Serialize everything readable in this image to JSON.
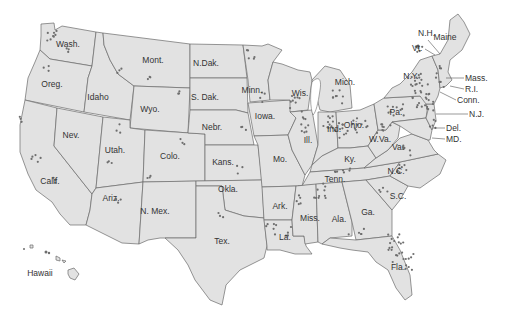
{
  "map": {
    "title": "",
    "background": "#ffffff",
    "state_fill": "#e2e2e2",
    "border_color": "#6a6a6a",
    "dot_color": "#6e6e6e",
    "labels": [
      {
        "id": "wash",
        "text": "Wash.",
        "x": 68,
        "y": 47
      },
      {
        "id": "oreg",
        "text": "Oreg.",
        "x": 52,
        "y": 87
      },
      {
        "id": "idaho",
        "text": "Idaho",
        "x": 98,
        "y": 100
      },
      {
        "id": "mont",
        "text": "Mont.",
        "x": 153,
        "y": 63
      },
      {
        "id": "wyo",
        "text": "Wyo.",
        "x": 150,
        "y": 112
      },
      {
        "id": "ndak",
        "text": "N.Dak.",
        "x": 206,
        "y": 66
      },
      {
        "id": "sdak",
        "text": "S. Dak.",
        "x": 205,
        "y": 100
      },
      {
        "id": "nebr",
        "text": "Nebr.",
        "x": 212,
        "y": 130
      },
      {
        "id": "nev",
        "text": "Nev.",
        "x": 71,
        "y": 138
      },
      {
        "id": "utah",
        "text": "Utah.",
        "x": 115,
        "y": 153
      },
      {
        "id": "colo",
        "text": "Colo.",
        "x": 170,
        "y": 159
      },
      {
        "id": "kans",
        "text": "Kans.",
        "x": 223,
        "y": 165
      },
      {
        "id": "calif",
        "text": "Calif.",
        "x": 50,
        "y": 184
      },
      {
        "id": "ariz",
        "text": "Ariz.",
        "x": 111,
        "y": 201
      },
      {
        "id": "nmex",
        "text": "N. Mex.",
        "x": 155,
        "y": 214
      },
      {
        "id": "okla",
        "text": "Okla.",
        "x": 228,
        "y": 192
      },
      {
        "id": "tex",
        "text": "Tex.",
        "x": 222,
        "y": 244
      },
      {
        "id": "minn",
        "text": "Minn.",
        "x": 252,
        "y": 93
      },
      {
        "id": "iowa",
        "text": "Iowa.",
        "x": 265,
        "y": 119
      },
      {
        "id": "wis",
        "text": "Wis.",
        "x": 300,
        "y": 96
      },
      {
        "id": "mich",
        "text": "Mich.",
        "x": 345,
        "y": 85
      },
      {
        "id": "ill",
        "text": "Ill.",
        "x": 308,
        "y": 143
      },
      {
        "id": "ind",
        "text": "Ind.",
        "x": 334,
        "y": 132
      },
      {
        "id": "ohio",
        "text": "Ohio.",
        "x": 354,
        "y": 128
      },
      {
        "id": "mo",
        "text": "Mo.",
        "x": 280,
        "y": 162
      },
      {
        "id": "ky",
        "text": "Ky.",
        "x": 350,
        "y": 162
      },
      {
        "id": "wva",
        "text": "W.Va.",
        "x": 380,
        "y": 142
      },
      {
        "id": "va",
        "text": "Va.",
        "x": 398,
        "y": 150
      },
      {
        "id": "tenn",
        "text": "Tenn.",
        "x": 335,
        "y": 182
      },
      {
        "id": "nc",
        "text": "N.C.",
        "x": 396,
        "y": 174
      },
      {
        "id": "sc",
        "text": "S.C.",
        "x": 398,
        "y": 199
      },
      {
        "id": "ark",
        "text": "Ark.",
        "x": 280,
        "y": 209
      },
      {
        "id": "miss",
        "text": "Miss.",
        "x": 310,
        "y": 221
      },
      {
        "id": "ala",
        "text": "Ala.",
        "x": 339,
        "y": 222
      },
      {
        "id": "ga",
        "text": "Ga.",
        "x": 368,
        "y": 215
      },
      {
        "id": "la",
        "text": "La.",
        "x": 285,
        "y": 240
      },
      {
        "id": "fla",
        "text": "Fla.",
        "x": 398,
        "y": 270
      },
      {
        "id": "ny",
        "text": "N.Y.",
        "x": 411,
        "y": 79
      },
      {
        "id": "pa",
        "text": "Pa.",
        "x": 396,
        "y": 115
      },
      {
        "id": "maine",
        "text": "Maine",
        "x": 445,
        "y": 40
      },
      {
        "id": "hawaii",
        "text": "Hawaii",
        "x": 40,
        "y": 276
      }
    ],
    "leader_labels": [
      {
        "id": "nh",
        "text": "N.H.",
        "x": 418,
        "y": 36,
        "lx1": 428,
        "ly1": 40,
        "lx2": 440,
        "ly2": 54
      },
      {
        "id": "vt",
        "text": "Vt.",
        "x": 412,
        "y": 51,
        "lx1": 425,
        "ly1": 49,
        "lx2": 435,
        "ly2": 55
      },
      {
        "id": "mass",
        "text": "Mass.",
        "x": 465,
        "y": 81,
        "lx1": 446,
        "ly1": 78,
        "lx2": 464,
        "ly2": 78
      },
      {
        "id": "ri",
        "text": "R.I.",
        "x": 465,
        "y": 92,
        "lx1": 450,
        "ly1": 86,
        "lx2": 464,
        "ly2": 89
      },
      {
        "id": "conn",
        "text": "Conn.",
        "x": 457,
        "y": 103,
        "lx1": 440,
        "ly1": 92,
        "lx2": 456,
        "ly2": 100
      },
      {
        "id": "nj",
        "text": "N.J.",
        "x": 469,
        "y": 117,
        "lx1": 436,
        "ly1": 114,
        "lx2": 468,
        "ly2": 114
      },
      {
        "id": "del",
        "text": "Del.",
        "x": 446,
        "y": 131,
        "lx1": 432,
        "ly1": 128,
        "lx2": 445,
        "ly2": 128
      },
      {
        "id": "md",
        "text": "MD.",
        "x": 446,
        "y": 142,
        "lx1": 432,
        "ly1": 138,
        "lx2": 445,
        "ly2": 139
      }
    ]
  }
}
